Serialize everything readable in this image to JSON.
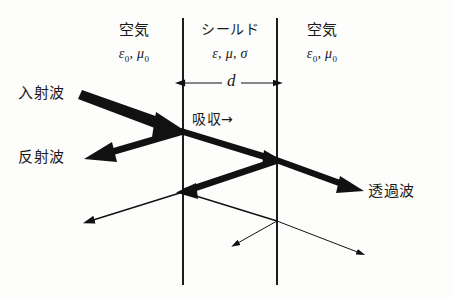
{
  "figure": {
    "background_color": "#fdfdfc",
    "ink_color": "#111111"
  },
  "regions": [
    {
      "id": "left-air",
      "name": "空気",
      "parameters": "ε0, μ0",
      "parameter_parts": {
        "eps": "ε",
        "eps_sub": "0",
        "sep": ", ",
        "mu": "μ",
        "mu_sub": "0"
      }
    },
    {
      "id": "shield",
      "name": "シールド",
      "parameters": "ε, μ, σ",
      "parameter_parts": {
        "eps": "ε",
        "mu": "μ",
        "sigma": "σ"
      }
    },
    {
      "id": "right-air",
      "name": "空気",
      "parameters": "ε0, μ0",
      "parameter_parts": {
        "eps": "ε",
        "eps_sub": "0",
        "sep": ", ",
        "mu": "μ",
        "mu_sub": "0"
      }
    }
  ],
  "dimension": {
    "label": "d",
    "description": "shield thickness"
  },
  "waves": {
    "incident": "入射波",
    "reflected": "反射波",
    "absorption": "吸収",
    "absorption_arrow": "→",
    "transmitted": "透過波"
  },
  "geometry": {
    "boundary_left_x": 183,
    "boundary_right_x": 277,
    "boundary_top_y": 18,
    "boundary_bottom_y": 285,
    "hit_point_front": [
      183,
      131
    ],
    "hit_point_back": [
      277,
      160
    ],
    "hit_point_front2": [
      183,
      192
    ],
    "hit_point_back2": [
      277,
      221
    ],
    "incident_start": [
      83,
      94
    ],
    "reflected_end": [
      88,
      159
    ],
    "transmitted_end": [
      362,
      191
    ],
    "secondary_reflect_end": [
      88,
      222
    ],
    "secondary_transmit_end": [
      362,
      253
    ],
    "internal_leak_end": [
      233,
      245
    ]
  }
}
